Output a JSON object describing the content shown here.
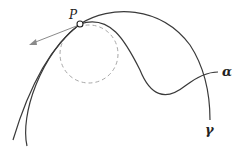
{
  "diagram": {
    "point": {
      "label": "P",
      "x": 80,
      "y": 24
    },
    "curves": [
      {
        "name": "gamma",
        "label": "γ",
        "label_x": 206,
        "label_y": 133
      },
      {
        "name": "alpha",
        "label": "α",
        "label_x": 222,
        "label_y": 75
      }
    ],
    "osculating_circle": {
      "cx": 89,
      "cy": 54,
      "r": 29,
      "style": "dashed"
    },
    "tangent_arrow": {
      "from": [
        80,
        24
      ],
      "to": [
        30,
        44
      ]
    },
    "colors": {
      "curve": "#3a3a3a",
      "circle": "#a8a8a8",
      "arrow": "#8a8a8a",
      "label": "#222222"
    }
  }
}
